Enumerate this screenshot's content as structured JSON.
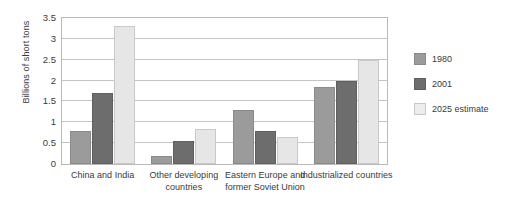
{
  "chart_data": {
    "type": "bar",
    "title": "",
    "subtitle": "",
    "xlabel": "",
    "ylabel": "Billions of short tons",
    "ylim": [
      0,
      3.5
    ],
    "yticks": [
      "0",
      "0.5",
      "1",
      "1.5",
      "2",
      "2.5",
      "3",
      "3.5"
    ],
    "ytick_values": [
      0,
      0.5,
      1,
      1.5,
      2,
      2.5,
      3,
      3.5
    ],
    "grid": true,
    "legend_position": "right",
    "categories": [
      "China and India",
      "Other developing countries",
      "Eastern Europe and former Soviet Union",
      "Industrialized countries"
    ],
    "series": [
      {
        "name": "1980",
        "color": "#9b9b9b",
        "values": [
          0.8,
          0.2,
          1.3,
          1.85
        ]
      },
      {
        "name": "2001",
        "color": "#6d6d6d",
        "values": [
          1.7,
          0.55,
          0.8,
          2.0
        ]
      },
      {
        "name": "2025 estimate",
        "color": "#ededed",
        "values": [
          3.3,
          0.85,
          0.65,
          2.5
        ]
      }
    ]
  },
  "legend": {
    "items": [
      {
        "label": "1980"
      },
      {
        "label": "2001"
      },
      {
        "label": "2025 estimate"
      }
    ]
  },
  "axis": {
    "y_title": "Billions of short tons"
  }
}
